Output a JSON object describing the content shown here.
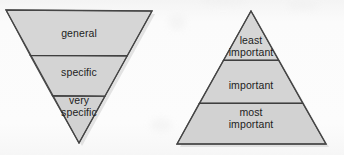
{
  "figure": {
    "type": "diagram",
    "background_color": "#fdfdfd",
    "shape_fill_color": "#d4d4d4",
    "shape_stroke_color": "#4a4a4a",
    "text_color": "#1d1d1d"
  },
  "diagrams": [
    {
      "name": "inverted-triangle",
      "orientation": "inverted",
      "geometry": {
        "top_left": [
          6,
          10
        ],
        "top_right": [
          152,
          11
        ],
        "apex": [
          79,
          143
        ],
        "divider_y": [
          55,
          95
        ]
      },
      "bands": [
        {
          "id": "band-general",
          "lines": [
            "general"
          ],
          "label": "general",
          "position": "top"
        },
        {
          "id": "band-specific",
          "lines": [
            "specific"
          ],
          "label": "specific",
          "position": "middle"
        },
        {
          "id": "band-very-specific",
          "lines": [
            "very",
            "specific"
          ],
          "label": "very specific",
          "position": "bottom"
        }
      ]
    },
    {
      "name": "upright-pyramid",
      "orientation": "upright",
      "geometry": {
        "apex": [
          251,
          11
        ],
        "bottom_left": [
          177,
          144
        ],
        "bottom_right": [
          326,
          144
        ],
        "divider_y": [
          60,
          103
        ]
      },
      "bands": [
        {
          "id": "band-least-important",
          "lines": [
            "least",
            "important"
          ],
          "label": "least important",
          "position": "top"
        },
        {
          "id": "band-important",
          "lines": [
            "important"
          ],
          "label": "important",
          "position": "middle"
        },
        {
          "id": "band-most-important",
          "lines": [
            "most",
            "important"
          ],
          "label": "most important",
          "position": "bottom"
        }
      ]
    }
  ],
  "labels": {
    "left": {
      "general": "general",
      "specific": "specific",
      "very": "very",
      "very_specific": "specific"
    },
    "right": {
      "least": "least",
      "least_important": "important",
      "important": "important",
      "most": "most",
      "most_important": "important"
    }
  }
}
